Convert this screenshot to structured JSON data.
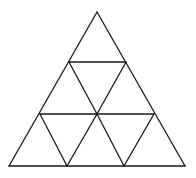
{
  "figure": {
    "stroke_color": "#1a1a1a",
    "stroke_width": 1.3,
    "background": "#ffffff",
    "vertices": {
      "apex": [
        97,
        12
      ],
      "base_left": [
        9,
        166
      ],
      "base_right": [
        185,
        166
      ],
      "row1_left": [
        69,
        62
      ],
      "row1_right": [
        126,
        62
      ],
      "row2_left": [
        40,
        114
      ],
      "row2_center": [
        97,
        114
      ],
      "row2_right": [
        154,
        114
      ],
      "base_mid_left": [
        67,
        166
      ],
      "base_mid_right": [
        124,
        166
      ]
    },
    "segments": [
      {
        "name": "outer-left-edge",
        "from": [
          97,
          12
        ],
        "to": [
          9,
          166
        ]
      },
      {
        "name": "outer-right-edge",
        "from": [
          97,
          12
        ],
        "to": [
          185,
          166
        ]
      },
      {
        "name": "outer-base",
        "from": [
          9,
          166
        ],
        "to": [
          185,
          166
        ]
      },
      {
        "name": "row1-horizontal",
        "from": [
          69,
          62
        ],
        "to": [
          126,
          62
        ]
      },
      {
        "name": "row2-horizontal",
        "from": [
          40,
          114
        ],
        "to": [
          154,
          114
        ]
      },
      {
        "name": "mid-left-diagonal",
        "from": [
          69,
          62
        ],
        "to": [
          97,
          114
        ]
      },
      {
        "name": "mid-right-diagonal",
        "from": [
          126,
          62
        ],
        "to": [
          97,
          114
        ]
      },
      {
        "name": "bottom-diagonal-1",
        "from": [
          40,
          114
        ],
        "to": [
          67,
          166
        ]
      },
      {
        "name": "bottom-diagonal-2",
        "from": [
          97,
          114
        ],
        "to": [
          67,
          166
        ]
      },
      {
        "name": "bottom-diagonal-3",
        "from": [
          97,
          114
        ],
        "to": [
          124,
          166
        ]
      },
      {
        "name": "bottom-diagonal-4",
        "from": [
          154,
          114
        ],
        "to": [
          124,
          166
        ]
      }
    ]
  }
}
